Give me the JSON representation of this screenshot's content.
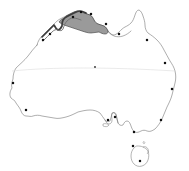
{
  "map": {
    "title": "Australia",
    "subject": "Australia outline map with highlighted northern coastal region",
    "projection_note": "continental outline",
    "background_color": "#ffffff",
    "outline_color": "#6b6b6b",
    "highlight_fill_color": "#9a9a9a",
    "highlight_outline_color": "#3d3d3d",
    "graticule_color": "#dcdcdc",
    "marker_color": "#111111",
    "width": 189,
    "height": 171
  },
  "graticule": {
    "name": "tropic-of-capricorn",
    "label": "",
    "y": 68
  },
  "highlight": {
    "name": "northern-coastal-region",
    "label": "",
    "fill": "#9a9a9a"
  },
  "markers": [
    {
      "name": "marker-kimberley-coast",
      "label": "",
      "x": 43,
      "y": 40
    },
    {
      "name": "marker-darwin",
      "label": "",
      "x": 50,
      "y": 34
    },
    {
      "name": "marker-arnhem-west",
      "label": "",
      "x": 73,
      "y": 17
    },
    {
      "name": "marker-arnhem-east",
      "label": "",
      "x": 81,
      "y": 12
    },
    {
      "name": "marker-gove",
      "label": "",
      "x": 91,
      "y": 14
    },
    {
      "name": "marker-top-end-south",
      "label": "",
      "x": 106,
      "y": 24
    },
    {
      "name": "marker-gulf-coast",
      "label": "",
      "x": 119,
      "y": 34
    },
    {
      "name": "marker-cairns",
      "label": "",
      "x": 147,
      "y": 40
    },
    {
      "name": "marker-rockhampton",
      "label": "",
      "x": 165,
      "y": 63
    },
    {
      "name": "marker-brisbane",
      "label": "",
      "x": 172,
      "y": 89
    },
    {
      "name": "marker-sydney",
      "label": "",
      "x": 161,
      "y": 120
    },
    {
      "name": "marker-canberra",
      "label": "",
      "x": 134,
      "y": 132
    },
    {
      "name": "marker-melbourne",
      "label": "",
      "x": 133,
      "y": 146
    },
    {
      "name": "marker-adelaide",
      "label": "",
      "x": 115,
      "y": 117
    },
    {
      "name": "marker-port-lincoln",
      "label": "",
      "x": 108,
      "y": 120
    },
    {
      "name": "marker-perth",
      "label": "",
      "x": 26,
      "y": 110
    },
    {
      "name": "marker-shark-bay",
      "label": "",
      "x": 13,
      "y": 83
    },
    {
      "name": "marker-hobart",
      "label": "",
      "x": 140,
      "y": 161
    },
    {
      "name": "marker-centre",
      "label": "",
      "x": 95,
      "y": 67
    }
  ]
}
